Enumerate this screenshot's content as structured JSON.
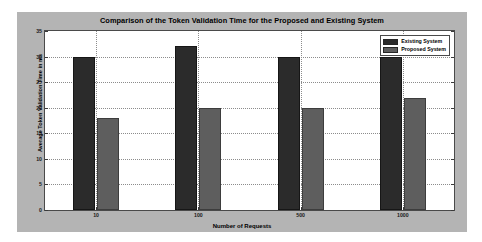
{
  "chart_data": {
    "type": "bar",
    "title": "Comparison of the Token Validation Time for the Proposed and Existing System",
    "xlabel": "Number of Requests",
    "ylabel": "Average Token Validation Time in ms",
    "categories": [
      "10",
      "100",
      "500",
      "1000"
    ],
    "series": [
      {
        "name": "Existing System",
        "color": "#2b2b2b",
        "values": [
          30,
          32,
          30,
          30
        ]
      },
      {
        "name": "Proposed System",
        "color": "#5e5e5e",
        "values": [
          18,
          20,
          20,
          22
        ]
      }
    ],
    "ylim": [
      0,
      35
    ],
    "yticks": [
      "0",
      "5",
      "10",
      "15",
      "20",
      "25",
      "30",
      "35"
    ],
    "ytick_values": [
      0,
      5,
      10,
      15,
      20,
      25,
      30,
      35
    ],
    "grid": true,
    "legend_position": "top-right",
    "figure_background": "#b4b4b4",
    "axes_background": "#ffffff"
  }
}
